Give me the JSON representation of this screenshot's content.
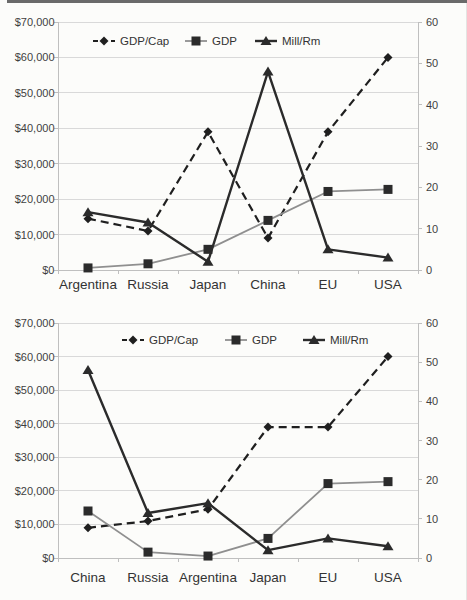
{
  "page": {
    "background": "#fcfcfa",
    "top_border_color": "#6a6a6a",
    "edge_shadow_color": "#e4e4e2"
  },
  "chart_style": {
    "grid_color": "#d9d9d9",
    "axis_color": "#bfbfbf",
    "tick_color": "#bfbfbf",
    "text_color": "#3f3f3f",
    "label_color": "#333333"
  },
  "chart_data": [
    {
      "type": "line",
      "title": "",
      "categories": [
        "Argentina",
        "Russia",
        "Japan",
        "China",
        "EU",
        "USA"
      ],
      "series": [
        {
          "name": "GDP/Cap",
          "axis": "left",
          "values": [
            14500,
            11000,
            39000,
            9000,
            39000,
            60000
          ],
          "color": "#1f1f1f",
          "marker": "diamond",
          "marker_color": "#1f1f1f",
          "dashed": true,
          "line_width": 2.2
        },
        {
          "name": "GDP",
          "axis": "right",
          "values": [
            0.5,
            1.5,
            5,
            12,
            19,
            19.5
          ],
          "color": "#8f8f8f",
          "marker": "square",
          "marker_color": "#2b2b2b",
          "dashed": false,
          "line_width": 1.8
        },
        {
          "name": "Mill/Rm",
          "axis": "right",
          "values": [
            14,
            11.5,
            2,
            48,
            5,
            3
          ],
          "color": "#2b2b2b",
          "marker": "triangle",
          "marker_color": "#2b2b2b",
          "dashed": false,
          "line_width": 2.4
        }
      ],
      "left_axis": {
        "tick_labels": [
          "$70,000",
          "$60,000",
          "$50,000",
          "$40,000",
          "$30,000",
          "$20,000",
          "$10,000",
          "$0"
        ],
        "min": 0,
        "max": 70000
      },
      "right_axis": {
        "tick_labels": [
          "60",
          "50",
          "40",
          "30",
          "20",
          "10",
          "0"
        ],
        "min": 0,
        "max": 60
      },
      "legend": [
        "GDP/Cap",
        "GDP",
        "Mill/Rm"
      ],
      "legend_position": "top-center",
      "grid": true
    },
    {
      "type": "line",
      "title": "",
      "categories": [
        "China",
        "Russia",
        "Argentina",
        "Japan",
        "EU",
        "USA"
      ],
      "series": [
        {
          "name": "GDP/Cap",
          "axis": "left",
          "values": [
            9000,
            11000,
            14500,
            39000,
            39000,
            60000
          ],
          "color": "#1f1f1f",
          "marker": "diamond",
          "marker_color": "#1f1f1f",
          "dashed": true,
          "line_width": 2.2
        },
        {
          "name": "GDP",
          "axis": "right",
          "values": [
            12,
            1.5,
            0.5,
            5,
            19,
            19.5
          ],
          "color": "#8f8f8f",
          "marker": "square",
          "marker_color": "#2b2b2b",
          "dashed": false,
          "line_width": 1.8
        },
        {
          "name": "Mill/Rm",
          "axis": "right",
          "values": [
            48,
            11.5,
            14,
            2,
            5,
            3
          ],
          "color": "#2b2b2b",
          "marker": "triangle",
          "marker_color": "#2b2b2b",
          "dashed": false,
          "line_width": 2.4
        }
      ],
      "left_axis": {
        "tick_labels": [
          "$70,000",
          "$60,000",
          "$50,000",
          "$40,000",
          "$30,000",
          "$20,000",
          "$10,000",
          "$0"
        ],
        "min": 0,
        "max": 70000
      },
      "right_axis": {
        "tick_labels": [
          "60",
          "50",
          "40",
          "30",
          "20",
          "10",
          "0"
        ],
        "min": 0,
        "max": 60
      },
      "legend": [
        "GDP/Cap",
        "GDP",
        "Mill/Rm"
      ],
      "legend_position": "top-center",
      "grid": true
    }
  ]
}
